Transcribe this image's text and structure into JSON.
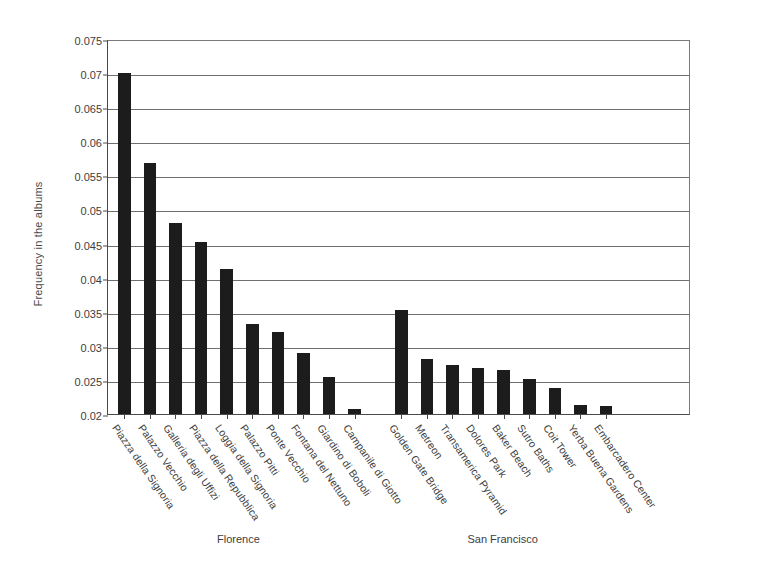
{
  "chart_data": {
    "type": "bar",
    "title": "",
    "xlabel": "",
    "ylabel": "Frequency in the albums",
    "ylim": [
      0.02,
      0.075
    ],
    "ytick_values": [
      0.02,
      0.025,
      0.03,
      0.035,
      0.04,
      0.045,
      0.05,
      0.055,
      0.06,
      0.065,
      0.07,
      0.075
    ],
    "ytick_labels": [
      "0.02",
      "0.025",
      "0.03",
      "0.035",
      "0.04",
      "0.045",
      "0.05",
      "0.055",
      "0.06",
      "0.065",
      "0.07",
      "0.075"
    ],
    "grid": true,
    "legend": "none",
    "bar_color": "#1c1c1c",
    "groups": [
      {
        "name": "Florence",
        "categories": [
          "Piazza della Signoria",
          "Palazzo Vecchio",
          "Galleria degli Uffizi",
          "Piazza della Repubblica",
          "Loggia della Signoria",
          "Palazzo Pitti",
          "Ponte Vecchio",
          "Fontana del Nettuno",
          "Giardino di Boboli",
          "Campanile di Giotto"
        ],
        "values": [
          0.07,
          0.0568,
          0.048,
          0.0452,
          0.0412,
          0.0332,
          0.032,
          0.029,
          0.0255,
          0.0207
        ]
      },
      {
        "name": "San Francisco",
        "categories": [
          "Golden Gate Bridge",
          "Metreon",
          "Transamerica Pyramid",
          "Dolores Park",
          "Baker Beach",
          "Sutro Baths",
          "Coit Tower",
          "Yerba Buena Gardens",
          "Embarcadero Center"
        ],
        "values": [
          0.0352,
          0.028,
          0.0272,
          0.0267,
          0.0265,
          0.0252,
          0.0238,
          0.0213,
          0.0212
        ]
      }
    ]
  },
  "group_labels": [
    {
      "text": "Florence"
    },
    {
      "text": "San Francisco"
    }
  ]
}
